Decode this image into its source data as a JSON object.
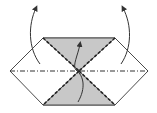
{
  "diagram": {
    "type": "origami-fold-instruction",
    "colors": {
      "background": "#ffffff",
      "outline": "#4a4a4a",
      "shaded_flap": "#c8c8c8",
      "fold_line": "#333333",
      "arrow": "#333333"
    },
    "shape": "hexagon",
    "elements": {
      "outline": "hexagon-outline",
      "top_flap": "shaded-triangle-top",
      "bottom_flap": "shaded-triangle-bottom",
      "horizontal_crease": "mountain-fold-line",
      "diagonal_creases": "valley-fold-lines",
      "arrows": [
        "left-fold-arrow",
        "right-fold-arrow",
        "center-fold-arrow"
      ]
    }
  }
}
